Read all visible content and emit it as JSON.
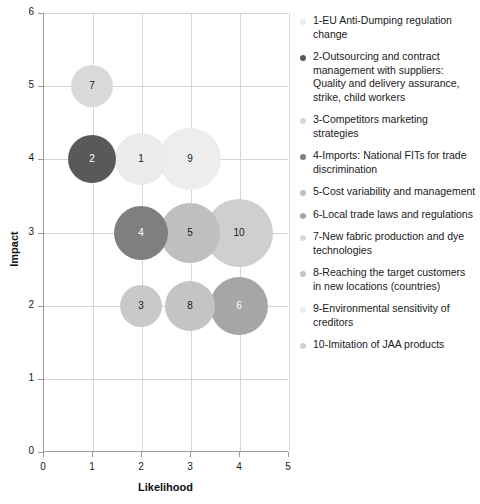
{
  "chart_data": {
    "type": "scatter",
    "title": "",
    "xlabel": "Likelihood",
    "ylabel": "Impact",
    "xlim": [
      0,
      5
    ],
    "ylim": [
      0,
      6
    ],
    "xticks": [
      "0",
      "1",
      "2",
      "3",
      "4",
      "5"
    ],
    "yticks": [
      "0",
      "1",
      "2",
      "3",
      "4",
      "5",
      "6"
    ],
    "grid": true,
    "legend_position": "right",
    "bubbles": [
      {
        "id": "1",
        "x": 2,
        "y": 4,
        "r": 26,
        "color": "#ebebeb",
        "text_color": "#1a1a1a",
        "label": "1"
      },
      {
        "id": "2",
        "x": 1,
        "y": 4,
        "r": 24,
        "color": "#595959",
        "text_color": "#ffffff",
        "label": "2"
      },
      {
        "id": "3",
        "x": 2,
        "y": 2,
        "r": 21,
        "color": "#c9c9c9",
        "text_color": "#1a1a1a",
        "label": "3"
      },
      {
        "id": "4",
        "x": 2,
        "y": 3,
        "r": 27,
        "color": "#7f7f7f",
        "text_color": "#ffffff",
        "label": "4"
      },
      {
        "id": "5",
        "x": 3,
        "y": 3,
        "r": 30,
        "color": "#bfbfbf",
        "text_color": "#1a1a1a",
        "label": "5"
      },
      {
        "id": "6",
        "x": 4,
        "y": 2,
        "r": 29,
        "color": "#a6a6a6",
        "text_color": "#ffffff",
        "label": "6"
      },
      {
        "id": "7",
        "x": 1,
        "y": 5,
        "r": 21,
        "color": "#d9d9d9",
        "text_color": "#1a1a1a",
        "label": "7"
      },
      {
        "id": "8",
        "x": 3,
        "y": 2,
        "r": 25,
        "color": "#c4c4c4",
        "text_color": "#1a1a1a",
        "label": "8"
      },
      {
        "id": "9",
        "x": 3,
        "y": 4,
        "r": 31,
        "color": "#ededed",
        "text_color": "#1a1a1a",
        "label": "9"
      },
      {
        "id": "10",
        "x": 4,
        "y": 3,
        "r": 34,
        "color": "#cfcfcf",
        "text_color": "#1a1a1a",
        "label": "10"
      }
    ],
    "legend": [
      {
        "marker_color": "#ebebeb",
        "label": "1-EU Anti-Dumping regulation change"
      },
      {
        "marker_color": "#595959",
        "label": "2-Outsourcing and contract management with suppliers: Quality and delivery assurance, strike, child workers"
      },
      {
        "marker_color": "#d9d9d9",
        "label": "3-Competitors marketing strategies"
      },
      {
        "marker_color": "#7f7f7f",
        "label": "4-Imports: National FITs for trade discrimination"
      },
      {
        "marker_color": "#bfbfbf",
        "label": "5-Cost variability and management"
      },
      {
        "marker_color": "#a6a6a6",
        "label": "6-Local trade laws and regulations"
      },
      {
        "marker_color": "#d9d9d9",
        "label": "7-New fabric production and dye technologies"
      },
      {
        "marker_color": "#c4c4c4",
        "label": "8-Reaching the target customers in new locations (countries)"
      },
      {
        "marker_color": "#ededed",
        "label": "9-Environmental sensitivity of creditors"
      },
      {
        "marker_color": "#cfcfcf",
        "label": "10-Imitation of JAA products"
      }
    ]
  },
  "colors": {
    "axis": "#9c9c9c",
    "grid": "#d6d6d6",
    "text": "#1a1a1a"
  }
}
